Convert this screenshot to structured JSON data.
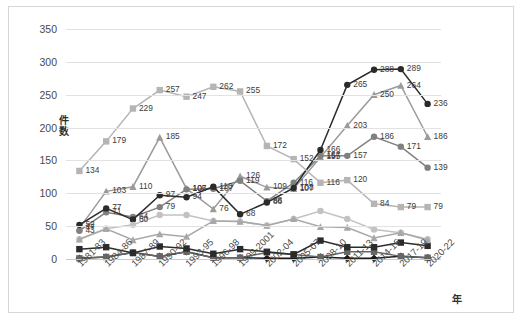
{
  "chart_data": {
    "type": "line",
    "title": "",
    "xlabel": "年",
    "ylabel": "件数",
    "ylim": [
      0,
      350
    ],
    "yticks": [
      0,
      50,
      100,
      150,
      200,
      250,
      300,
      350
    ],
    "grid": true,
    "legend_position": "right",
    "categories": [
      "1981-83",
      "1984-86",
      "1987-89",
      "1990-92",
      "1993-95",
      "1996-98",
      "1999-2001",
      "2002-04",
      "2005-07",
      "2008-10",
      "2011-13",
      "2014-16",
      "2017-19",
      "2020-22"
    ],
    "series": [
      {
        "name": "脊椎",
        "color": "#1a1a1a",
        "marker": "dia",
        "values": [
          1,
          3,
          10,
          4,
          11,
          2,
          2,
          1,
          1,
          3,
          1,
          1,
          4,
          2
        ],
        "labels": [
          "",
          "",
          "",
          "",
          "",
          "",
          "",
          "",
          "",
          "",
          "",
          "",
          "",
          ""
        ]
      },
      {
        "name": "肩",
        "color": "#666666",
        "marker": "sq",
        "values": [
          1,
          3,
          10,
          4,
          11,
          2,
          2,
          10,
          7,
          3,
          11,
          11,
          4,
          2
        ],
        "labels": [
          "",
          "",
          "",
          "",
          "",
          "",
          "",
          "",
          "",
          "",
          "",
          "",
          "",
          ""
        ]
      },
      {
        "name": "肘",
        "color": "#9b9b9b",
        "marker": "tri",
        "values": [
          47,
          103,
          110,
          185,
          107,
          76,
          126,
          109,
          107,
          155,
          203,
          250,
          264,
          186
        ],
        "labels": [
          "47",
          "103",
          "110",
          "185",
          "107",
          "76",
          "126",
          "109",
          "107",
          "155",
          "203",
          "250",
          "264",
          "186"
        ]
      },
      {
        "name": "手関節",
        "color": "#808080",
        "marker": "cir",
        "values": [
          43,
          71,
          64,
          79,
          106,
          107,
          119,
          88,
          116,
          157,
          157,
          186,
          171,
          139
        ],
        "labels": [
          "43",
          "71",
          "64",
          "79",
          "106",
          "107",
          "119",
          "88",
          "116",
          "157",
          "157",
          "186",
          "171",
          "139"
        ]
      },
      {
        "name": "手指",
        "color": "#2b2b2b",
        "marker": "cir",
        "values": [
          52,
          77,
          60,
          97,
          94,
          110,
          68,
          86,
          108,
          166,
          265,
          288,
          289,
          236
        ],
        "labels": [
          "52",
          "77",
          "60",
          "97",
          "94",
          "110",
          "68",
          "86",
          "108",
          "166",
          "265",
          "288",
          "289",
          "236"
        ]
      },
      {
        "name": "股",
        "color": "#c2c2c2",
        "marker": "cir",
        "values": [
          30,
          46,
          52,
          67,
          67,
          58,
          57,
          51,
          61,
          73,
          61,
          45,
          40,
          30
        ],
        "labels": [
          "",
          "",
          "",
          "",
          "",
          "",
          "",
          "",
          "",
          "",
          "",
          "",
          "",
          ""
        ]
      },
      {
        "name": "膝",
        "color": "#b5b5b5",
        "marker": "sq",
        "values": [
          134,
          179,
          229,
          257,
          247,
          262,
          255,
          172,
          152,
          116,
          120,
          84,
          79,
          79
        ],
        "labels": [
          "134",
          "179",
          "229",
          "257",
          "247",
          "262",
          "255",
          "172",
          "152",
          "116",
          "120",
          "84",
          "79",
          "79"
        ]
      },
      {
        "name": "足関節",
        "color": "#2b2b2b",
        "marker": "sq",
        "values": [
          15,
          18,
          9,
          19,
          16,
          8,
          15,
          11,
          7,
          28,
          18,
          18,
          25,
          20
        ],
        "labels": [
          "",
          "",
          "",
          "",
          "",
          "",
          "",
          "",
          "",
          "",
          "",
          "",
          "",
          ""
        ]
      },
      {
        "name": "足趾",
        "color": "#a8a8a8",
        "marker": "tri",
        "values": [
          30,
          46,
          29,
          38,
          34,
          58,
          57,
          51,
          61,
          49,
          48,
          32,
          40,
          29
        ],
        "labels": [
          "",
          "",
          "",
          "",
          "",
          "",
          "",
          "",
          "",
          "",
          "",
          "",
          "",
          ""
        ]
      }
    ],
    "extra_labels": [
      {
        "text": "107",
        "x": 216,
        "y": 152
      },
      {
        "text": "110",
        "x": 196,
        "y": 159
      },
      {
        "text": "106",
        "x": 161,
        "y": 152
      },
      {
        "text": "94",
        "x": 165,
        "y": 160
      },
      {
        "text": "166",
        "x": 276,
        "y": 130
      },
      {
        "text": "155",
        "x": 278,
        "y": 138
      },
      {
        "text": "139",
        "x": 276,
        "y": 146
      },
      {
        "text": "152",
        "x": 262,
        "y": 136
      },
      {
        "text": "116",
        "x": 262,
        "y": 154
      },
      {
        "text": "108",
        "x": 260,
        "y": 161
      },
      {
        "text": "86",
        "x": 235,
        "y": 172
      },
      {
        "text": "88",
        "x": 235,
        "y": 179
      },
      {
        "text": "119",
        "x": 213,
        "y": 160
      },
      {
        "text": "126",
        "x": 213,
        "y": 151
      },
      {
        "text": "77",
        "x": 88,
        "y": 181
      },
      {
        "text": "71",
        "x": 88,
        "y": 190
      },
      {
        "text": "64",
        "x": 112,
        "y": 186
      },
      {
        "text": "60",
        "x": 112,
        "y": 194
      },
      {
        "text": "79",
        "x": 140,
        "y": 180
      },
      {
        "text": "76",
        "x": 192,
        "y": 184
      },
      {
        "text": "68",
        "x": 215,
        "y": 187
      },
      {
        "text": "107",
        "x": 258,
        "y": 180
      }
    ]
  }
}
